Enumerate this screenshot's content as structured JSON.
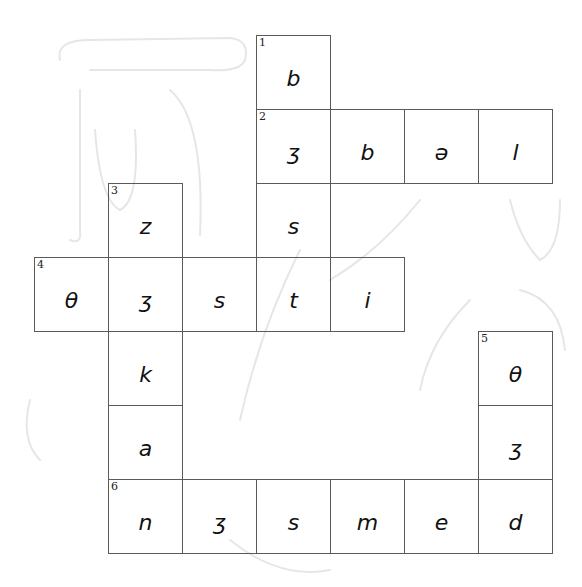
{
  "puzzle": {
    "type": "crossword",
    "cell_size": 74,
    "origin": {
      "x": 34,
      "y": 35
    },
    "border_color": "#5a5a5a",
    "ink_color": "#111111",
    "cells": [
      {
        "row": 0,
        "col": 3,
        "number": "1",
        "letter": "b"
      },
      {
        "row": 1,
        "col": 3,
        "number": "2",
        "letter": "ʒ"
      },
      {
        "row": 1,
        "col": 4,
        "number": "",
        "letter": "b"
      },
      {
        "row": 1,
        "col": 5,
        "number": "",
        "letter": "ə"
      },
      {
        "row": 1,
        "col": 6,
        "number": "",
        "letter": "l"
      },
      {
        "row": 2,
        "col": 1,
        "number": "3",
        "letter": "z"
      },
      {
        "row": 2,
        "col": 3,
        "number": "",
        "letter": "s"
      },
      {
        "row": 3,
        "col": 0,
        "number": "4",
        "letter": "θ"
      },
      {
        "row": 3,
        "col": 1,
        "number": "",
        "letter": "ʒ"
      },
      {
        "row": 3,
        "col": 2,
        "number": "",
        "letter": "s"
      },
      {
        "row": 3,
        "col": 3,
        "number": "",
        "letter": "t"
      },
      {
        "row": 3,
        "col": 4,
        "number": "",
        "letter": "i"
      },
      {
        "row": 4,
        "col": 1,
        "number": "",
        "letter": "k"
      },
      {
        "row": 4,
        "col": 6,
        "number": "5",
        "letter": "θ"
      },
      {
        "row": 5,
        "col": 1,
        "number": "",
        "letter": "a"
      },
      {
        "row": 5,
        "col": 6,
        "number": "",
        "letter": "ʒ"
      },
      {
        "row": 6,
        "col": 1,
        "number": "6",
        "letter": "n"
      },
      {
        "row": 6,
        "col": 2,
        "number": "",
        "letter": "ʒ"
      },
      {
        "row": 6,
        "col": 3,
        "number": "",
        "letter": "s"
      },
      {
        "row": 6,
        "col": 4,
        "number": "",
        "letter": "m"
      },
      {
        "row": 6,
        "col": 5,
        "number": "",
        "letter": "e"
      },
      {
        "row": 6,
        "col": 6,
        "number": "",
        "letter": "d"
      }
    ],
    "words": [
      {
        "number": "1",
        "direction": "down",
        "answer": "bʒst"
      },
      {
        "number": "2",
        "direction": "across",
        "answer": "ʒbəl"
      },
      {
        "number": "3",
        "direction": "down",
        "answer": "zʒkan"
      },
      {
        "number": "4",
        "direction": "across",
        "answer": "θʒsti"
      },
      {
        "number": "5",
        "direction": "down",
        "answer": "θʒd"
      },
      {
        "number": "6",
        "direction": "across",
        "answer": "nʒsmed"
      }
    ]
  }
}
